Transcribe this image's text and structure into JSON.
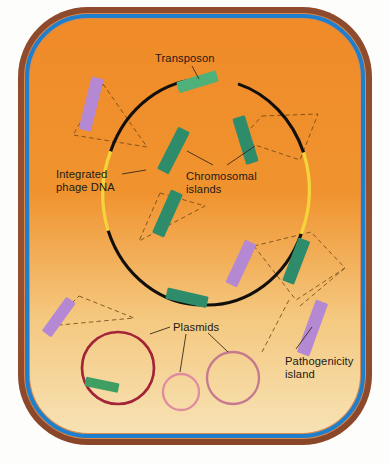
{
  "cell": {
    "wall_color": "#8f4b2d",
    "wall_inner_tint": "#c8743f",
    "membrane_color": "#1d7fcd",
    "cytoplasm_top_color": "#ee8b2c",
    "cytoplasm_bottom_color": "#f6dfae",
    "parts": {
      "cell_wall": "cell wall",
      "plasma_membrane": "plasma membrane",
      "cytoplasm": "cytoplasm"
    }
  },
  "chromosome": {
    "name": "bacterial chromosome",
    "backbone_color": "#120f0c",
    "phage_segment_color": "#f5d33a",
    "center": {
      "x": 206,
      "y": 192
    },
    "radius": {
      "x": 101,
      "y": 113
    }
  },
  "colors": {
    "transposon": "#4fb07a",
    "chromosomal_island": "#2f8c6b",
    "pathogenicity_island": "#b488d2",
    "integrated_phage_dna": "#f5d33a",
    "plasmid_large": "#a32338",
    "plasmid_medium": "#c4798f",
    "plasmid_small": "#e08ca0",
    "leader_line": "#5a3a14",
    "label_text": "#231a14"
  },
  "labels": [
    {
      "id": "transposon",
      "text": "Transposon",
      "x": 155,
      "y": 52
    },
    {
      "id": "integrated-phage-dna",
      "text": "Integrated\nphage DNA",
      "x": 56,
      "y": 168
    },
    {
      "id": "chromosomal-islands",
      "text": "Chromosomal\nislands",
      "x": 186,
      "y": 170
    },
    {
      "id": "plasmids",
      "text": "Plasmids",
      "x": 173,
      "y": 321
    },
    {
      "id": "pathogenicity-island",
      "text": "Pathogenicity\nisland",
      "x": 285,
      "y": 355
    }
  ],
  "elements": {
    "transposons": [
      {
        "id": "transposon-top",
        "x": 196,
        "y": 81,
        "w": 38,
        "h": 11,
        "angle": -16
      }
    ],
    "chromosomal_islands": [
      {
        "id": "island-upper-left",
        "x": 174,
        "y": 128,
        "w": 13,
        "h": 46,
        "angle": 27
      },
      {
        "id": "island-upper-right",
        "x": 245,
        "y": 117,
        "w": 13,
        "h": 47,
        "angle": -16
      },
      {
        "id": "island-mid-left",
        "x": 167,
        "y": 190,
        "w": 13,
        "h": 46,
        "angle": 24
      },
      {
        "id": "island-lower-right",
        "x": 296,
        "y": 239,
        "w": 12,
        "h": 44,
        "angle": 22
      },
      {
        "id": "island-bottom",
        "x": 185,
        "y": 295,
        "w": 40,
        "h": 11,
        "angle": 13
      },
      {
        "id": "island-plasmid",
        "x": 88,
        "y": 381,
        "w": 33,
        "h": 10,
        "angle": 12
      }
    ],
    "pathogenicity_islands": [
      {
        "id": "pai-top-left",
        "x": 90,
        "y": 80,
        "w": 12,
        "h": 52,
        "angle": 14
      },
      {
        "id": "pai-mid-right",
        "x": 241,
        "y": 241,
        "w": 12,
        "h": 46,
        "angle": 25
      },
      {
        "id": "pai-bottom-left",
        "x": 58,
        "y": 295,
        "w": 11,
        "h": 40,
        "angle": 36
      },
      {
        "id": "pai-bottom-right",
        "x": 312,
        "y": 302,
        "w": 13,
        "h": 54,
        "angle": 20
      }
    ],
    "integrated_phage_dna": [
      {
        "id": "phage-arc-left",
        "start_angle": 168,
        "end_angle": 205
      },
      {
        "id": "phage-arc-right",
        "start_angle": -17,
        "end_angle": 19
      }
    ],
    "plasmids": [
      {
        "id": "plasmid-large",
        "cx": 118,
        "cy": 368,
        "r": 36,
        "stroke": "#a32338",
        "width": 2.6,
        "has_green_insert": true
      },
      {
        "id": "plasmid-small",
        "cx": 181,
        "cy": 392,
        "r": 18,
        "stroke": "#e08ca0",
        "width": 2.2,
        "has_green_insert": false
      },
      {
        "id": "plasmid-medium",
        "cx": 233,
        "cy": 378,
        "r": 26,
        "stroke": "#c4798f",
        "width": 2.2,
        "has_green_insert": false
      }
    ]
  }
}
